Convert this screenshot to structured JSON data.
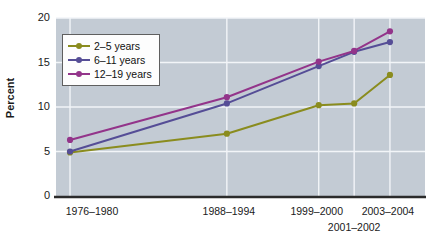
{
  "chart_data": {
    "type": "line",
    "title": "",
    "subtitle": "",
    "xlabel": "",
    "ylabel": "Percent",
    "ylim": [
      0,
      20
    ],
    "yticks": [
      0,
      5,
      10,
      15,
      20
    ],
    "grid": true,
    "legend_position": "top-left",
    "categories": [
      "1976–1980",
      "1988–1994",
      "1999–2000",
      "2001–2002",
      "2003–2004"
    ],
    "category_positions": [
      0.038,
      0.463,
      0.712,
      0.808,
      0.905
    ],
    "series": [
      {
        "name": "2–5 years",
        "color": "#8a8c1e",
        "values": [
          4.9,
          7.0,
          10.2,
          10.4,
          13.6
        ]
      },
      {
        "name": "6–11 years",
        "color": "#554d96",
        "values": [
          5.0,
          10.4,
          14.6,
          16.2,
          17.3
        ]
      },
      {
        "name": "12–19 years",
        "color": "#93348a",
        "values": [
          6.3,
          11.1,
          15.1,
          16.3,
          18.5
        ]
      }
    ]
  },
  "axes": {
    "y_title": "Percent",
    "y_tick_labels": [
      "0",
      "5",
      "10",
      "15",
      "20"
    ],
    "x_tick_labels_row1": [
      "1976–1980",
      "1988–1994",
      "1999–2000",
      "2003–2004"
    ],
    "x_tick_label_row2": "2001–2002"
  },
  "legend": {
    "items": [
      {
        "label": "2–5 years",
        "color": "#8a8c1e"
      },
      {
        "label": "6–11 years",
        "color": "#554d96"
      },
      {
        "label": "12–19 years",
        "color": "#93348a"
      }
    ]
  },
  "colors": {
    "plot_background": "#c3cbd4",
    "gridline": "#f2f5f8",
    "axis_line": "#2b2b2b",
    "page_background": "#ffffff",
    "text": "#1a1a1a"
  }
}
